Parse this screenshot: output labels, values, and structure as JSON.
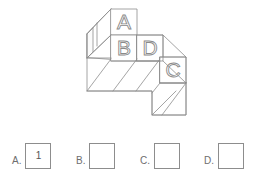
{
  "page": {
    "width": 277,
    "height": 180,
    "background": "#ffffff",
    "line_color": "#8d8d8d",
    "letter_color": "#8a8a8a",
    "label_color": "#6e6e6e"
  },
  "figure": {
    "name": "stacked-blocks-isometric-figure",
    "face_labels": [
      {
        "id": "A",
        "letter": "A",
        "x": 124,
        "y": 22
      },
      {
        "id": "B",
        "letter": "B",
        "x": 124,
        "y": 47
      },
      {
        "id": "D",
        "letter": "D",
        "x": 149,
        "y": 47
      },
      {
        "id": "C",
        "letter": "C",
        "x": 172,
        "y": 69
      }
    ]
  },
  "answers": {
    "prompt_choices": [
      {
        "key": "A",
        "label": "A.",
        "value": "1"
      },
      {
        "key": "B",
        "label": "B.",
        "value": ""
      },
      {
        "key": "C",
        "label": "C.",
        "value": ""
      },
      {
        "key": "D",
        "label": "D.",
        "value": ""
      }
    ]
  }
}
